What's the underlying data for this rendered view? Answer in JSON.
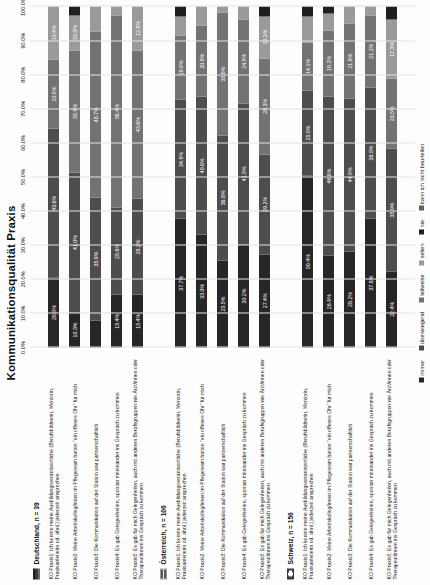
{
  "chart_data": {
    "type": "bar",
    "title": "Kommunikationsqualität Praxis",
    "orientation": "horizontal-stacked",
    "xlabel": "",
    "ylabel": "",
    "xlim": [
      0,
      100
    ],
    "grid": true,
    "legend_position": "bottom",
    "tick_labels": [
      "0.0%",
      "10.0%",
      "20.0%",
      "30.0%",
      "40.0%",
      "50.0%",
      "60.0%",
      "70.0%",
      "80.0%",
      "90.0%",
      "100.0%"
    ],
    "tick_values": [
      0,
      10,
      20,
      30,
      40,
      50,
      60,
      70,
      80,
      90,
      100
    ],
    "legend": [
      {
        "label": "immer",
        "color": "#262626"
      },
      {
        "label": "überwiegend",
        "color": "#4d4d4d"
      },
      {
        "label": "teilweise",
        "color": "#737373"
      },
      {
        "label": "selten",
        "color": "#9a9a9a"
      },
      {
        "label": "nie",
        "color": "#1f1f1f"
      },
      {
        "label": "kann ich nicht beurteilen",
        "color": "#5e5e5e"
      }
    ],
    "series_names": [
      "immer",
      "überwiegend",
      "teilweise",
      "selten",
      "nie",
      "kann ich nicht beurteilen"
    ],
    "groups": [
      {
        "name": "Deutschland, n = 39",
        "flag": "flag-de",
        "rows": [
          {
            "label": "KO Praxis1: Ich konnte meine Ausbildungsverantwortliche (Berufsbildnerin, Mentorin, Praxisanleiterin od. ähnl.) jederzeit ansprechen",
            "values": [
              20.5,
              43.6,
              20.5,
              15.4,
              0,
              0
            ],
            "labels": [
              "20.5%",
              "43.6%",
              "20.5%",
              "15.4%",
              "",
              ""
            ]
          },
          {
            "label": "KO Praxis2: Meine Arbeitskolleg/innen im Pflegeteam hatten \"ein offenes Ohr\" für mich",
            "values": [
              10.3,
              41.0,
              35.9,
              10.3,
              2.5,
              0
            ],
            "labels": [
              "10.3%",
              "41.0%",
              "35.9%",
              "10.3%",
              "",
              ""
            ]
          },
          {
            "label": "KO Praxis3: Die Kommunikation auf der Station war partnerschaftlich",
            "values": [
              8.0,
              35.9,
              48.7,
              7.4,
              0,
              0
            ],
            "labels": [
              "",
              "35.9%",
              "48.7%",
              "",
              "",
              ""
            ]
          },
          {
            "label": "KO Praxis4: Es gab Gelegenheiten, spontan miteinander ins Gespräch zu kommen",
            "values": [
              15.4,
              25.6,
              56.4,
              2.6,
              0,
              0
            ],
            "labels": [
              "15.4%",
              "25.6%",
              "56.4%",
              "",
              "",
              ""
            ]
          },
          {
            "label": "KO Praxis5: Es gab für mich Gelegenheiten, auch mit anderen Berufsgruppen wie Ärzt/innen oder Therapeut/innen ins Gespräch zu kommen",
            "values": [
              15.4,
              28.2,
              43.6,
              12.8,
              0,
              0
            ],
            "labels": [
              "15.4%",
              "28.2%",
              "43.6%",
              "12.8%",
              "",
              ""
            ]
          }
        ]
      },
      {
        "name": "Österreich, n = 106",
        "flag": "flag-at",
        "rows": [
          {
            "label": "KO Praxis1: Ich konnte meine Ausbildungsverantwortliche (Berufsbildnerin, Mentorin, Praxisanleiterin od. ähnl.) jederzeit ansprechen",
            "values": [
              37.7,
              34.9,
              18.9,
              5.7,
              2.8,
              0
            ],
            "labels": [
              "37.7%",
              "34.9%",
              "18.9%",
              "",
              "",
              ""
            ]
          },
          {
            "label": "KO Praxis2: Meine Arbeitskolleg/innen im Pflegeteam hatten \"ein offenes Ohr\" für mich",
            "values": [
              33.0,
              40.6,
              20.8,
              5.6,
              0,
              0
            ],
            "labels": [
              "33.0%",
              "40.6%",
              "20.8%",
              "",
              "",
              ""
            ]
          },
          {
            "label": "KO Praxis3: Die Kommunikation auf der Station war partnerschaftlich",
            "values": [
              25.5,
              36.8,
              35.8,
              1.9,
              0,
              0
            ],
            "labels": [
              "25.5%",
              "36.8%",
              "35.8%",
              "",
              "",
              ""
            ]
          },
          {
            "label": "KO Praxis4: Es gab Gelegenheiten, spontan miteinander ins Gespräch zu kommen",
            "values": [
              30.2,
              41.5,
              24.5,
              3.8,
              0,
              0
            ],
            "labels": [
              "30.2%",
              "41.5%",
              "24.5%",
              "",
              "",
              ""
            ]
          },
          {
            "label": "KO Praxis5: Es gab für mich Gelegenheiten, auch mit anderen Berufsgruppen wie Ärzt/innen oder Therapeut/innen ins Gespräch zu kommen",
            "values": [
              27.4,
              29.2,
              28.3,
              12.3,
              2.8,
              0
            ],
            "labels": [
              "27.4%",
              "29.2%",
              "28.3%",
              "12.3%",
              "",
              ""
            ]
          }
        ]
      },
      {
        "name": "Schweiz, n = 156",
        "flag": "flag-ch",
        "rows": [
          {
            "label": "KO Praxis1: Ich konnte meine Ausbildungsverantwortliche (Berufsbildnerin, Mentorin, Praxisanleiterin od. ähnl.) jederzeit ansprechen",
            "values": [
              50.4,
              25.0,
              14.1,
              7.5,
              3.0,
              0
            ],
            "labels": [
              "50.4%",
              "25.0%",
              "14.1%",
              "",
              "",
              ""
            ]
          },
          {
            "label": "KO Praxis2: Meine Arbeitskolleg/innen im Pflegeteam hatten \"ein offenes Ohr\" für mich",
            "values": [
              26.9,
              46.8,
              19.2,
              5.1,
              2.0,
              0
            ],
            "labels": [
              "26.9%",
              "46.8%",
              "19.2%",
              "",
              "",
              ""
            ]
          },
          {
            "label": "KO Praxis3: Die Kommunikation auf der Station war partnerschaftlich",
            "values": [
              28.2,
              44.9,
              21.8,
              5.1,
              0,
              0
            ],
            "labels": [
              "28.2%",
              "44.9%",
              "21.8%",
              "",
              "",
              ""
            ]
          },
          {
            "label": "KO Praxis4: Es gab Gelegenheiten, spontan miteinander ins Gespräch zu kommen",
            "values": [
              37.8,
              38.5,
              21.2,
              2.5,
              0,
              0
            ],
            "labels": [
              "37.8%",
              "38.5%",
              "21.2%",
              "",
              "",
              ""
            ]
          },
          {
            "label": "KO Praxis5: Es gab für mich Gelegenheiten, auch mit anderen Berufsgruppen wie Ärzt/innen oder Therapeut/innen ins Gespräch zu kommen",
            "values": [
              22.4,
              35.9,
              20.5,
              17.3,
              3.9,
              0
            ],
            "labels": [
              "22.4%",
              "35.9%",
              "20.5%",
              "17.3%",
              "",
              ""
            ]
          }
        ]
      }
    ]
  }
}
